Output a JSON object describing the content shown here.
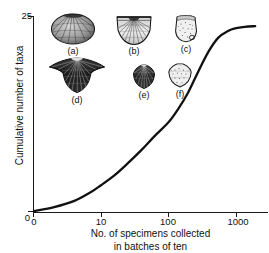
{
  "chart_data": {
    "type": "line",
    "title": "",
    "xlabel": "No. of specimens collected in batches of ten",
    "xlabel_line1": "No. of specimens collected",
    "xlabel_line2": "in batches of ten",
    "ylabel": "Cumulative number of taxa",
    "xscale": "log",
    "xticks": [
      0,
      10,
      100,
      1000
    ],
    "xticklabels": [
      "0",
      "10",
      "100",
      "1000"
    ],
    "yticks": [
      0,
      25
    ],
    "yticklabels": [
      "0",
      "25"
    ],
    "ylim": [
      0,
      25
    ],
    "grid": false,
    "legend": false,
    "series": [
      {
        "name": "Cumulative taxa",
        "x": [
          1,
          2,
          4,
          7,
          10,
          16,
          25,
          40,
          63,
          100,
          140,
          200,
          280,
          400,
          560,
          800,
          1000,
          1400,
          2000
        ],
        "values": [
          0.0,
          0.5,
          1.3,
          2.4,
          3.3,
          4.6,
          6.1,
          7.8,
          9.6,
          11.3,
          13.0,
          15.2,
          17.8,
          20.4,
          22.2,
          23.1,
          23.4,
          23.6,
          23.7
        ]
      }
    ],
    "annotations": [
      "Curve rises from origin, inflects near 200-300 specimens, and plateaus just below 25 taxa."
    ]
  },
  "clipped_caption": ". . . . . . . . . . . . . . . . . . .",
  "specimens": {
    "caption": "Brachiopod taxa illustrated above the curve",
    "items": [
      {
        "id": "a",
        "label": "(a)",
        "shape": "oval-ribbed-shell",
        "shade": "mottled"
      },
      {
        "id": "b",
        "label": "(b)",
        "shape": "fan-shell-straight-hinge",
        "shade": "fine-radial"
      },
      {
        "id": "c",
        "label": "(c)",
        "shape": "small-squarish-shell",
        "shade": "speckled"
      },
      {
        "id": "d",
        "label": "(d)",
        "shape": "winged-alate-shell",
        "shade": "dark-ribbed"
      },
      {
        "id": "e",
        "label": "(e)",
        "shape": "small-ribbed-shell",
        "shade": "dark"
      },
      {
        "id": "f",
        "label": "(f)",
        "shape": "pentagonal-shell",
        "shade": "speckled"
      }
    ]
  },
  "colors": {
    "curve": "#111111",
    "axis": "#1a1a1a",
    "text": "#111111",
    "background": "#ffffff"
  }
}
